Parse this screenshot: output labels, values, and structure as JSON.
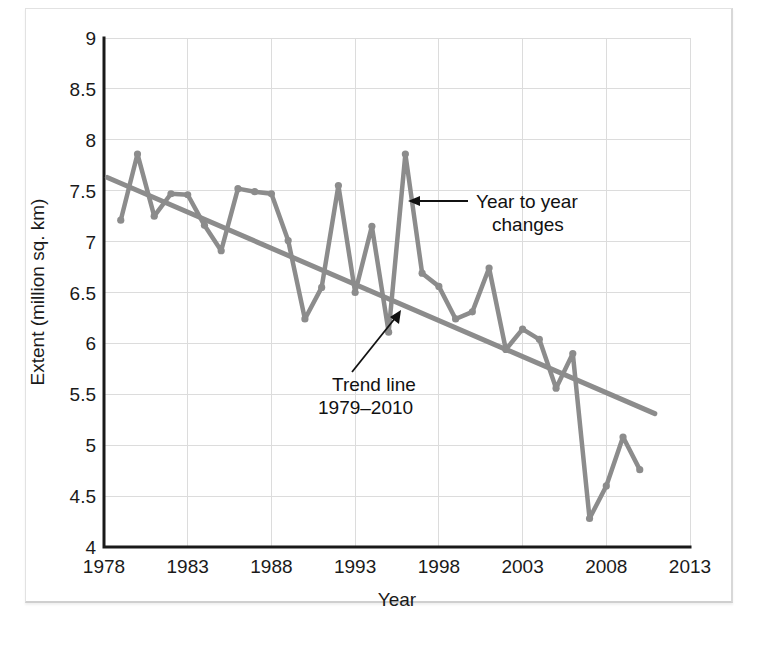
{
  "figure": {
    "background_color": "#ffffff",
    "panel_border_color": "#e2e2e2"
  },
  "chart_data": {
    "type": "line",
    "title": "",
    "xlabel": "Year",
    "ylabel": "Extent (million sq. km)",
    "xlim": [
      1978,
      2013
    ],
    "ylim": [
      4,
      9
    ],
    "xticks": [
      "1978",
      "1983",
      "1988",
      "1993",
      "1998",
      "2003",
      "2008",
      "2013"
    ],
    "xtick_values": [
      1978,
      1983,
      1988,
      1993,
      1998,
      2003,
      2008,
      2013
    ],
    "yticks": [
      "4",
      "4.5",
      "5",
      "5.5",
      "6",
      "6.5",
      "7",
      "7.5",
      "8",
      "8.5",
      "9"
    ],
    "ytick_values": [
      4,
      4.5,
      5,
      5.5,
      6,
      6.5,
      7,
      7.5,
      8,
      8.5,
      9
    ],
    "grid": true,
    "legend_position": "none",
    "series": [
      {
        "name": "Year to year changes",
        "color": "#8c8c8c",
        "marker": "circle",
        "x": [
          1979,
          1980,
          1981,
          1982,
          1983,
          1984,
          1985,
          1986,
          1987,
          1988,
          1989,
          1990,
          1991,
          1992,
          1993,
          1994,
          1995,
          1996,
          1997,
          1998,
          1999,
          2000,
          2001,
          2002,
          2003,
          2004,
          2005,
          2006,
          2007,
          2008,
          2009,
          2010
        ],
        "values": [
          7.21,
          7.86,
          7.25,
          7.47,
          7.46,
          7.16,
          6.91,
          7.52,
          7.49,
          7.47,
          7.01,
          6.24,
          6.55,
          7.55,
          6.5,
          7.15,
          6.11,
          7.86,
          6.69,
          6.56,
          6.24,
          6.31,
          6.74,
          5.94,
          6.14,
          6.04,
          5.56,
          5.9,
          4.28,
          4.6,
          5.08,
          4.76
        ]
      },
      {
        "name": "Trend line 1979–2010",
        "color": "#8c8c8c",
        "type": "trend",
        "x": [
          1978.2,
          2010.9
        ],
        "values": [
          7.63,
          5.31
        ]
      }
    ],
    "annotations": [
      {
        "id": "year-to-year-changes",
        "lines": [
          "Year to year",
          "changes"
        ],
        "text": "Year to year changes",
        "arrow": "left"
      },
      {
        "id": "trend-line",
        "lines": [
          "Trend line",
          "1979–2010"
        ],
        "text": "Trend line 1979–2010",
        "arrow": "up-right"
      }
    ]
  }
}
